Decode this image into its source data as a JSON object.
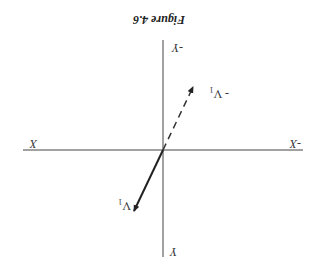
{
  "figure": {
    "title": "Figure 4.6",
    "orientation": "rotated 180 degrees",
    "axes": {
      "x_positive_label": "X",
      "x_negative_label": "-X",
      "y_positive_label": "Y",
      "y_negative_label": "-Y"
    },
    "vectors": [
      {
        "name": "V1",
        "label": "V",
        "subscript": "1",
        "style": "solid",
        "color": "#222222"
      },
      {
        "name": "-V1",
        "label": "- V",
        "subscript": "1",
        "style": "dashed",
        "color": "#333333"
      }
    ]
  }
}
